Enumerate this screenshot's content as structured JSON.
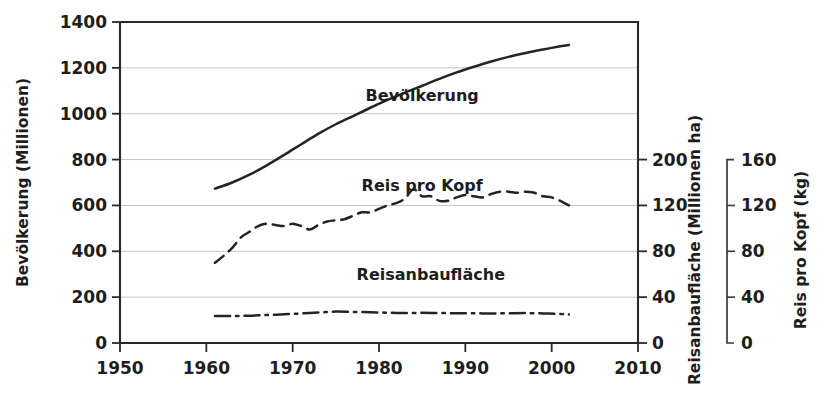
{
  "chart_data": {
    "type": "line",
    "title": "",
    "xlabel": "",
    "ylabel": "Bevölkerung (Millionen)",
    "xlim": [
      1950,
      2010
    ],
    "ylim": [
      0,
      1400
    ],
    "grid": true,
    "legend_position": "inline-right",
    "x_ticks": [
      1950,
      1960,
      1970,
      1980,
      1990,
      2000,
      2010
    ],
    "y_ticks": [
      0,
      200,
      400,
      600,
      800,
      1000,
      1200,
      1400
    ],
    "axes": [
      {
        "id": "left",
        "title": "Bevölkerung (Millionen)",
        "ticks": [
          0,
          200,
          400,
          600,
          800,
          1000,
          1200,
          1400
        ],
        "tick_labels": [
          "0",
          "200",
          "400",
          "600",
          "800",
          "1000",
          "1200",
          "1400"
        ],
        "range": [
          0,
          1400
        ]
      },
      {
        "id": "right-area",
        "title": "Reisanbaufläche (Millionen ha)",
        "ticks": [
          0,
          40,
          80,
          120,
          200
        ],
        "tick_labels": [
          "0",
          "40",
          "80",
          "120",
          "200"
        ],
        "range": [
          0,
          200
        ]
      },
      {
        "id": "right-percap",
        "title": "Reis pro Kopf (kg)",
        "ticks": [
          0,
          40,
          80,
          120,
          160
        ],
        "tick_labels": [
          "0",
          "40",
          "80",
          "120",
          "160"
        ],
        "range": [
          0,
          160
        ]
      }
    ],
    "series": [
      {
        "name": "Bevölkerung",
        "axis": "left",
        "unit": "Millionen",
        "style": "solid",
        "label_x": 1985,
        "label_y": 1080,
        "x": [
          1961,
          1963,
          1965,
          1967,
          1969,
          1971,
          1973,
          1975,
          1977,
          1979,
          1981,
          1983,
          1985,
          1987,
          1989,
          1991,
          1993,
          1995,
          1997,
          1999,
          2001,
          2002
        ],
        "values": [
          673,
          700,
          734,
          775,
          820,
          867,
          913,
          954,
          990,
          1026,
          1060,
          1092,
          1122,
          1152,
          1180,
          1205,
          1228,
          1248,
          1265,
          1280,
          1294,
          1300
        ]
      },
      {
        "name": "Reis pro Kopf",
        "axis": "right-percap",
        "unit": "kg",
        "style": "dashed",
        "label_x": 1985,
        "label_y": 690,
        "x": [
          1961,
          1962,
          1963,
          1964,
          1965,
          1966,
          1967,
          1968,
          1969,
          1970,
          1971,
          1972,
          1973,
          1974,
          1975,
          1976,
          1977,
          1978,
          1979,
          1980,
          1981,
          1982,
          1983,
          1984,
          1985,
          1986,
          1987,
          1988,
          1989,
          1990,
          1991,
          1992,
          1993,
          1994,
          1995,
          1996,
          1997,
          1998,
          1999,
          2000,
          2001,
          2002
        ],
        "values": [
          70,
          76,
          83,
          92,
          97,
          102,
          104,
          103,
          102,
          104,
          102,
          99,
          103,
          106,
          107,
          108,
          111,
          114,
          114,
          117,
          120,
          122,
          126,
          134,
          128,
          128,
          124,
          124,
          127,
          129,
          128,
          127,
          130,
          132,
          132,
          131,
          132,
          131,
          128,
          127,
          124,
          120
        ]
      },
      {
        "name": "Reisanbaufläche",
        "axis": "right-area",
        "unit": "Millionen ha",
        "style": "dashdot",
        "label_x": 1986,
        "label_y": 300,
        "x": [
          1961,
          1963,
          1965,
          1967,
          1969,
          1971,
          1973,
          1975,
          1977,
          1979,
          1981,
          1983,
          1985,
          1987,
          1989,
          1991,
          1993,
          1995,
          1997,
          1999,
          2001,
          2002
        ],
        "values": [
          23.5,
          23.6,
          23.8,
          24.4,
          25.0,
          25.8,
          26.6,
          27.4,
          27.1,
          26.9,
          26.4,
          26.2,
          26.3,
          26.1,
          26.0,
          25.9,
          25.8,
          25.9,
          26.1,
          25.8,
          25.3,
          24.9
        ]
      }
    ]
  }
}
